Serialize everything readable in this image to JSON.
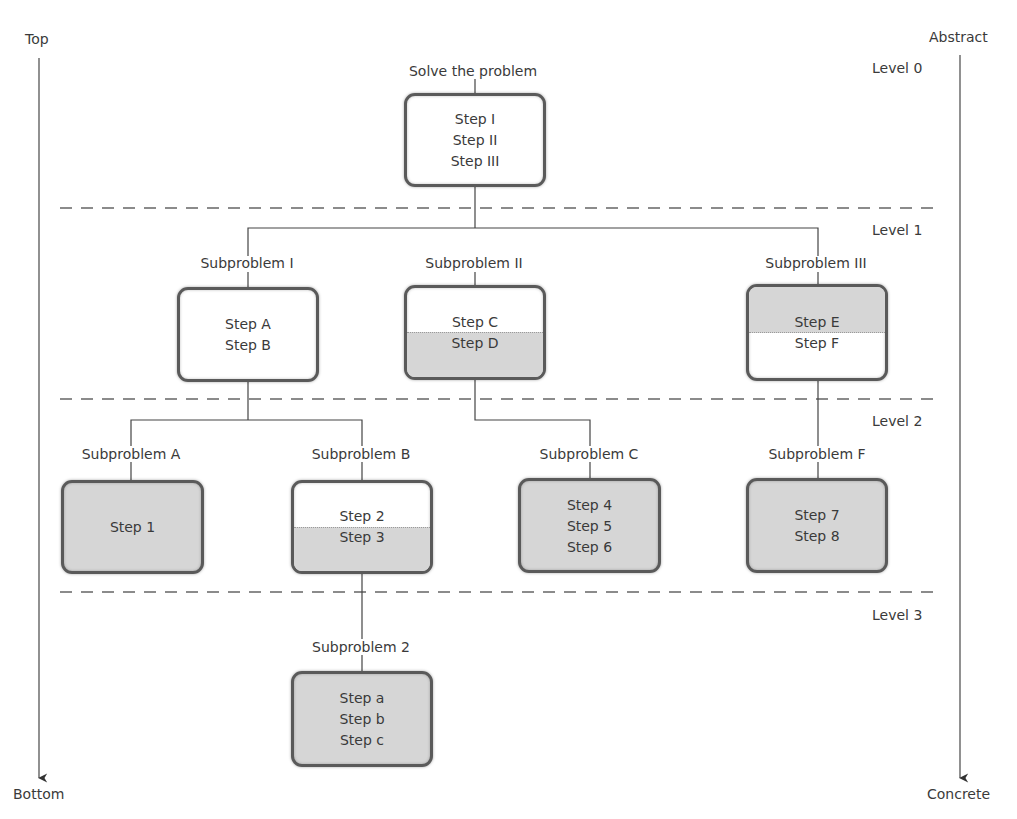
{
  "axes": {
    "left": {
      "top_label": "Top",
      "bottom_label": "Bottom"
    },
    "right": {
      "top_label": "Abstract",
      "bottom_label": "Concrete"
    }
  },
  "levels": [
    {
      "label": "Level 0"
    },
    {
      "label": "Level 1"
    },
    {
      "label": "Level 2"
    },
    {
      "label": "Level 3"
    }
  ],
  "colors": {
    "box_border": "#5a5a5a",
    "box_fill_white": "#ffffff",
    "box_fill_gray": "#d6d6d6",
    "line": "#444444",
    "dash": "#666666",
    "text": "#3a3a3a"
  },
  "nodes": {
    "root": {
      "title": "Solve the problem",
      "steps": [
        "Step I",
        "Step II",
        "Step III"
      ],
      "fill": "white"
    },
    "sub_I": {
      "title": "Subproblem I",
      "steps": [
        "Step A",
        "Step B"
      ],
      "fill": "white"
    },
    "sub_II": {
      "title": "Subproblem II",
      "steps": [
        "Step C",
        "Step D"
      ],
      "fill": "split-bottom-gray"
    },
    "sub_III": {
      "title": "Subproblem III",
      "steps": [
        "Step E",
        "Step F"
      ],
      "fill": "split-top-gray"
    },
    "sub_A": {
      "title": "Subproblem A",
      "steps": [
        "Step 1"
      ],
      "fill": "gray"
    },
    "sub_B": {
      "title": "Subproblem B",
      "steps": [
        "Step 2",
        "Step 3"
      ],
      "fill": "split-bottom-gray"
    },
    "sub_C": {
      "title": "Subproblem C",
      "steps": [
        "Step 4",
        "Step 5",
        "Step 6"
      ],
      "fill": "gray"
    },
    "sub_F": {
      "title": "Subproblem F",
      "steps": [
        "Step 7",
        "Step 8"
      ],
      "fill": "gray"
    },
    "sub_2": {
      "title": "Subproblem 2",
      "steps": [
        "Step a",
        "Step b",
        "Step c"
      ],
      "fill": "gray"
    }
  }
}
